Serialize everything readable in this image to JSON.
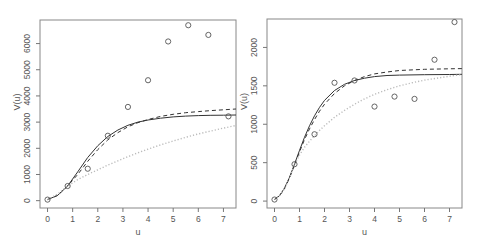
{
  "chart_data": [
    {
      "type": "scatter",
      "title": "",
      "xlabel": "u",
      "ylabel": "V(u)",
      "xlim": [
        -0.3,
        7.5
      ],
      "ylim": [
        -280,
        6900
      ],
      "xticks": [
        0,
        1,
        2,
        3,
        4,
        5,
        6,
        7
      ],
      "yticks": [
        0,
        1000,
        2000,
        3000,
        4000,
        5000,
        6000
      ],
      "grid": false,
      "points": {
        "name": "observed",
        "x": [
          0,
          0.8,
          1.6,
          2.4,
          3.2,
          4.0,
          4.8,
          5.6,
          6.4,
          7.2
        ],
        "y": [
          40,
          560,
          1220,
          2480,
          3580,
          4600,
          6080,
          6700,
          6330,
          3220
        ]
      },
      "series": [
        {
          "name": "model-solid",
          "style": "solid",
          "color": "#333333",
          "x": [
            0,
            0.4,
            0.8,
            1.2,
            1.6,
            2.0,
            2.4,
            2.8,
            3.2,
            3.6,
            4.0,
            4.5,
            5.0,
            5.5,
            6.0,
            6.5,
            7.0,
            7.5
          ],
          "y": [
            40,
            200,
            560,
            1100,
            1650,
            2100,
            2450,
            2700,
            2880,
            3000,
            3080,
            3150,
            3200,
            3230,
            3250,
            3260,
            3265,
            3270
          ]
        },
        {
          "name": "model-dashed",
          "style": "dashed",
          "color": "#333333",
          "x": [
            0,
            0.4,
            0.8,
            1.2,
            1.6,
            2.0,
            2.4,
            2.8,
            3.2,
            3.6,
            4.0,
            4.5,
            5.0,
            5.5,
            6.0,
            6.5,
            7.0,
            7.5
          ],
          "y": [
            40,
            200,
            560,
            1000,
            1500,
            1950,
            2320,
            2600,
            2820,
            2980,
            3100,
            3220,
            3300,
            3360,
            3400,
            3440,
            3470,
            3500
          ]
        },
        {
          "name": "model-dotted",
          "style": "dotted",
          "color": "#bbbbbb",
          "x": [
            0,
            0.4,
            0.8,
            1.2,
            1.6,
            2.0,
            2.4,
            2.8,
            3.2,
            3.6,
            4.0,
            4.5,
            5.0,
            5.5,
            6.0,
            6.5,
            7.0,
            7.5
          ],
          "y": [
            40,
            250,
            560,
            800,
            1000,
            1180,
            1360,
            1520,
            1680,
            1830,
            1970,
            2130,
            2280,
            2420,
            2550,
            2660,
            2770,
            2870
          ]
        }
      ]
    },
    {
      "type": "scatter",
      "title": "",
      "xlabel": "u",
      "ylabel": "V(u)",
      "xlim": [
        -0.3,
        7.5
      ],
      "ylim": [
        -90,
        2370
      ],
      "xticks": [
        0,
        1,
        2,
        3,
        4,
        5,
        6,
        7
      ],
      "yticks": [
        0,
        500,
        1000,
        1500,
        2000
      ],
      "grid": false,
      "points": {
        "name": "observed",
        "x": [
          0,
          0.8,
          1.6,
          2.4,
          3.2,
          4.0,
          4.8,
          5.6,
          6.4,
          7.2
        ],
        "y": [
          20,
          480,
          870,
          1540,
          1570,
          1230,
          1360,
          1330,
          1840,
          2330
        ]
      },
      "series": [
        {
          "name": "model-solid",
          "style": "solid",
          "color": "#333333",
          "x": [
            0,
            0.2,
            0.4,
            0.6,
            0.8,
            1.0,
            1.2,
            1.4,
            1.6,
            1.8,
            2.0,
            2.4,
            2.8,
            3.2,
            3.6,
            4.0,
            4.5,
            5.0,
            6.0,
            7.0,
            7.5
          ],
          "y": [
            20,
            70,
            170,
            310,
            480,
            660,
            830,
            980,
            1110,
            1220,
            1310,
            1440,
            1520,
            1570,
            1600,
            1620,
            1635,
            1640,
            1645,
            1648,
            1650
          ]
        },
        {
          "name": "model-dashed",
          "style": "dashed",
          "color": "#333333",
          "x": [
            0,
            0.2,
            0.4,
            0.6,
            0.8,
            1.0,
            1.2,
            1.4,
            1.6,
            1.8,
            2.0,
            2.4,
            2.8,
            3.2,
            3.6,
            4.0,
            4.5,
            5.0,
            6.0,
            7.0,
            7.5
          ],
          "y": [
            20,
            70,
            160,
            300,
            470,
            640,
            800,
            940,
            1060,
            1170,
            1260,
            1400,
            1500,
            1570,
            1620,
            1655,
            1680,
            1700,
            1715,
            1722,
            1725
          ]
        },
        {
          "name": "model-dotted",
          "style": "dotted",
          "color": "#bbbbbb",
          "x": [
            0,
            0.2,
            0.4,
            0.6,
            0.8,
            1.0,
            1.2,
            1.4,
            1.6,
            1.8,
            2.0,
            2.4,
            2.8,
            3.2,
            3.6,
            4.0,
            4.5,
            5.0,
            5.5,
            6.0,
            6.5,
            7.0,
            7.5
          ],
          "y": [
            20,
            70,
            160,
            300,
            470,
            600,
            700,
            780,
            850,
            920,
            980,
            1090,
            1180,
            1260,
            1330,
            1390,
            1450,
            1500,
            1540,
            1575,
            1600,
            1625,
            1645
          ]
        }
      ]
    }
  ]
}
